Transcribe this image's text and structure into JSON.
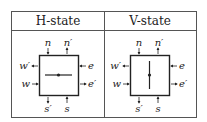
{
  "table": {
    "columns": [
      {
        "header": "H-state",
        "orientation": "horizontal"
      },
      {
        "header": "V-state",
        "orientation": "vertical"
      }
    ]
  },
  "labels": {
    "n": "n",
    "n_prime": "n′",
    "w_prime": "w′",
    "w": "w",
    "e": "e",
    "e_prime": "e′",
    "s_prime": "s′",
    "s": "s"
  },
  "colors": {
    "line": "#222222",
    "background": "#ffffff"
  }
}
